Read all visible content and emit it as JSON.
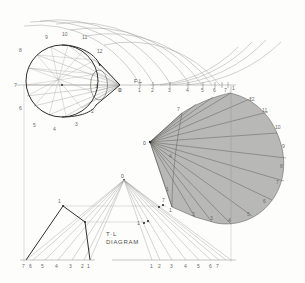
{
  "drawing": {
    "title": "T·L DIAGRAM",
    "sheet_bg": "#fdfdfc",
    "line_color": "#2e2e2c",
    "thin_color": "#a9a9a4",
    "fan_fill": "#8e8e8b",
    "labels": {
      "fl": "F.L",
      "tl_line1": "T·L",
      "tl_line2": "DIAGRAM",
      "apex": "0"
    }
  },
  "plan_view": {
    "name": "oblique-cone-plan-view",
    "apex_label": "0",
    "base_point_labels": [
      "1",
      "2",
      "3",
      "4",
      "5",
      "6",
      "7",
      "8",
      "9",
      "10",
      "11",
      "12"
    ],
    "center_mark": "·"
  },
  "fl_scale": {
    "name": "fl-baseline-scale",
    "origin_label": "0",
    "axis_label": "F.L",
    "ticks": [
      "1",
      "2",
      "3",
      "4",
      "5",
      "6",
      "7"
    ]
  },
  "arc_set": {
    "name": "radius-swing-arcs",
    "count": 7,
    "description": "concentric true-length arcs swung from apex 0 on F.L"
  },
  "development": {
    "name": "cone-pattern-development",
    "apex_label": "0",
    "outer_labels": [
      "1",
      "12",
      "11",
      "10",
      "9",
      "8",
      "7",
      "6",
      "5",
      "4",
      "3",
      "2",
      "1"
    ],
    "inner_labels": [
      "1",
      "2",
      "3",
      "4",
      "5",
      "6",
      "7"
    ],
    "ray_count": 13,
    "fill": "#8e8e8b"
  },
  "tl_diagram": {
    "name": "true-length-diagram",
    "apex_label": "0",
    "caption_1": "T·L",
    "caption_2": "DIAGRAM",
    "left_scale": [
      "7",
      "6",
      "5",
      "4",
      "3",
      "2",
      "1"
    ],
    "right_scale": [
      "1",
      "2",
      "3",
      "4",
      "5",
      "6",
      "7"
    ],
    "point_labels": [
      "1",
      "7",
      "1",
      "7"
    ]
  }
}
